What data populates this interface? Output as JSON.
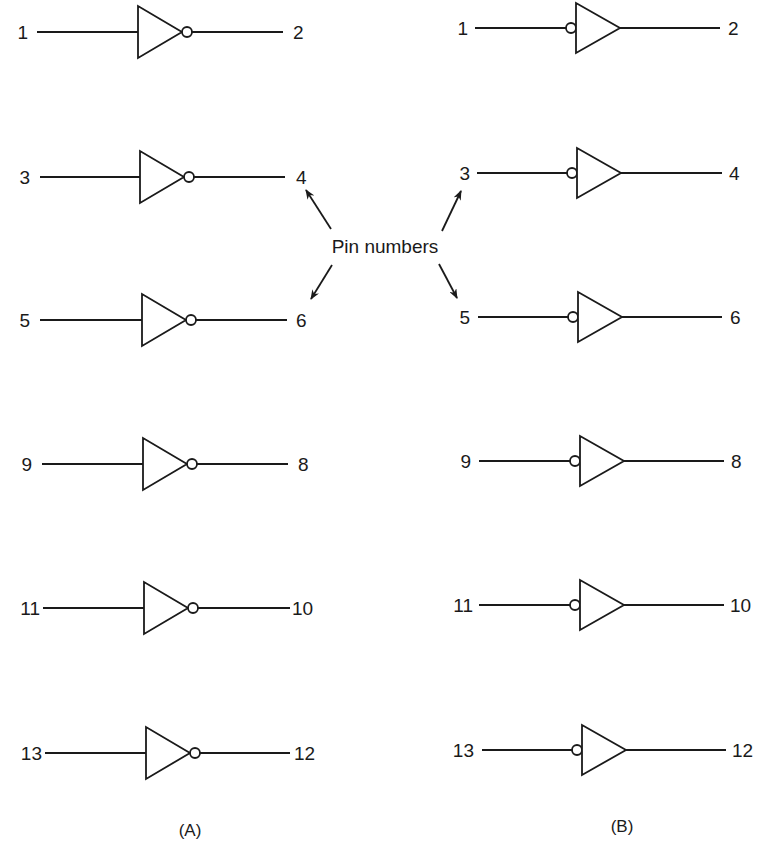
{
  "figure": {
    "annotation": "Pin numbers",
    "panels": [
      {
        "id": "A",
        "caption": "(A)",
        "gate_type": "inverter (output bubble)",
        "gates": [
          {
            "input_pin": "1",
            "output_pin": "2",
            "y": 32,
            "tx": 138,
            "in_x1": 37,
            "out_x2": 283,
            "in_lbl_x": 28,
            "out_lbl_x": 293
          },
          {
            "input_pin": "3",
            "output_pin": "4",
            "y": 177,
            "tx": 140,
            "in_x1": 40,
            "out_x2": 285,
            "in_lbl_x": 30,
            "out_lbl_x": 296
          },
          {
            "input_pin": "5",
            "output_pin": "6",
            "y": 320,
            "tx": 142,
            "in_x1": 40,
            "out_x2": 287,
            "in_lbl_x": 30,
            "out_lbl_x": 296
          },
          {
            "input_pin": "9",
            "output_pin": "8",
            "y": 464,
            "tx": 143,
            "in_x1": 42,
            "out_x2": 288,
            "in_lbl_x": 32,
            "out_lbl_x": 298
          },
          {
            "input_pin": "11",
            "output_pin": "10",
            "y": 608,
            "tx": 144,
            "in_x1": 43,
            "out_x2": 290,
            "in_lbl_x": 40,
            "out_lbl_x": 292
          },
          {
            "input_pin": "13",
            "output_pin": "12",
            "y": 753,
            "tx": 146,
            "in_x1": 45,
            "out_x2": 290,
            "in_lbl_x": 42,
            "out_lbl_x": 294
          }
        ]
      },
      {
        "id": "B",
        "caption": "(B)",
        "gate_type": "buffer with inverted input (input bubble)",
        "gates": [
          {
            "input_pin": "1",
            "output_pin": "2",
            "y": 28,
            "tx": 576,
            "in_x1": 475,
            "out_x2": 720,
            "in_lbl_x": 468,
            "out_lbl_x": 728
          },
          {
            "input_pin": "3",
            "output_pin": "4",
            "y": 173,
            "tx": 577,
            "in_x1": 477,
            "out_x2": 722,
            "in_lbl_x": 470,
            "out_lbl_x": 729
          },
          {
            "input_pin": "5",
            "output_pin": "6",
            "y": 317,
            "tx": 578,
            "in_x1": 478,
            "out_x2": 722,
            "in_lbl_x": 470,
            "out_lbl_x": 730
          },
          {
            "input_pin": "9",
            "output_pin": "8",
            "y": 461,
            "tx": 580,
            "in_x1": 479,
            "out_x2": 724,
            "in_lbl_x": 471,
            "out_lbl_x": 731
          },
          {
            "input_pin": "11",
            "output_pin": "10",
            "y": 605,
            "tx": 580,
            "in_x1": 479,
            "out_x2": 724,
            "in_lbl_x": 473,
            "out_lbl_x": 730
          },
          {
            "input_pin": "13",
            "output_pin": "12",
            "y": 750,
            "tx": 582,
            "in_x1": 482,
            "out_x2": 726,
            "in_lbl_x": 474,
            "out_lbl_x": 732
          }
        ]
      }
    ]
  }
}
